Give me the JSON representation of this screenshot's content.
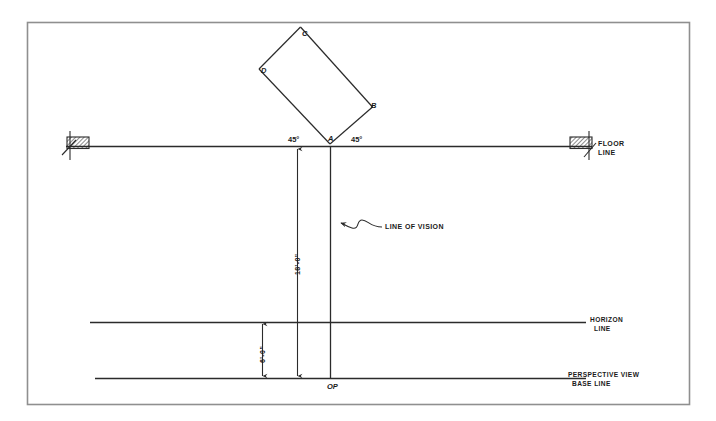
{
  "drawing": {
    "title_type": "perspective-setup-plan",
    "ink_color": "#2b2b2b",
    "frame_color": "#8a8a8a",
    "background": "#ffffff"
  },
  "labels": {
    "vertex_a": "A",
    "vertex_b": "B",
    "vertex_c": "C",
    "vertex_d": "D",
    "angle_left": "45°",
    "angle_right": "45°",
    "floor_line": "FLOOR",
    "floor_line2": "LINE",
    "line_of_vision": "LINE OF VISION",
    "dim_vertical_main": "18'-0\"",
    "dim_vertical_lower": "6'-0\"",
    "horizon_line": "HORIZON",
    "horizon_line2": "LINE",
    "base_line": "PERSPECTIVE VIEW",
    "base_line2": "BASE LINE",
    "observation_point": "OP"
  },
  "geometry": {
    "frame": {
      "x": 27,
      "y": 22,
      "width": 663,
      "height": 383
    },
    "floor_line": {
      "y": 146,
      "x1": 66,
      "x2": 592
    },
    "horizon_line": {
      "y": 322,
      "x1": 90,
      "x2": 586
    },
    "base_line": {
      "y": 378,
      "x1": 95,
      "x2": 586
    },
    "point_a": {
      "x": 330,
      "y": 146
    },
    "point_op": {
      "x": 330,
      "y": 378
    },
    "rect_vertices": {
      "a": {
        "x": 330,
        "y": 143
      },
      "b": {
        "x": 372,
        "y": 107
      },
      "c": {
        "x": 300,
        "y": 27
      },
      "d": {
        "x": 259,
        "y": 69
      }
    },
    "dim_line_main": {
      "x": 297,
      "y1": 148,
      "y2": 378
    },
    "dim_line_lower": {
      "x": 262,
      "y1": 322,
      "y2": 378
    },
    "vision_line": {
      "x": 330,
      "y1": 146,
      "y2": 378
    },
    "hatch_left": {
      "x": 67,
      "y": 138,
      "width": 22,
      "height": 12
    },
    "hatch_right": {
      "x": 570,
      "y": 138,
      "width": 22,
      "height": 12
    }
  }
}
